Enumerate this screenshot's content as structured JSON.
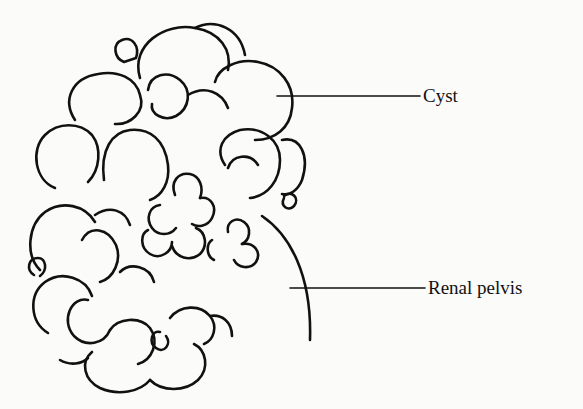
{
  "diagram": {
    "labels": [
      {
        "id": "cyst",
        "text": "Cyst"
      },
      {
        "id": "renal-pelvis",
        "text": "Renal pelvis"
      }
    ]
  },
  "colors": {
    "stroke": "#111111",
    "background": "#fbfbf9"
  }
}
